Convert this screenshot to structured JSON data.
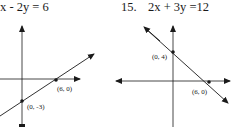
{
  "problems": [
    {
      "equation": "x - 2y = 6",
      "points": [
        {
          "label": "(6, 0)"
        },
        {
          "label": "(0, -3)"
        }
      ]
    },
    {
      "number": "15.",
      "equation": "2x + 3y =12",
      "points": [
        {
          "label": "(0, 4)"
        },
        {
          "label": "(6, 0)"
        }
      ]
    }
  ]
}
